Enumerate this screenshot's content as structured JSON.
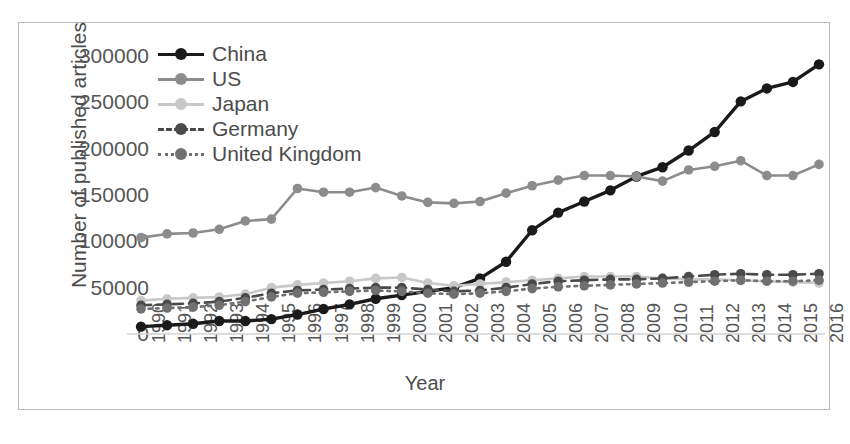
{
  "chart_data": {
    "type": "line",
    "title": "",
    "xlabel": "Year",
    "ylabel": "Number of published articles",
    "x": [
      1990,
      1991,
      1992,
      1993,
      1994,
      1995,
      1996,
      1997,
      1998,
      1999,
      2000,
      2001,
      2002,
      2003,
      2004,
      2005,
      2006,
      2007,
      2008,
      2009,
      2010,
      2011,
      2012,
      2013,
      2014,
      2015,
      2016
    ],
    "categories": [
      "1990",
      "1991",
      "1992",
      "1993",
      "1994",
      "1995",
      "1996",
      "1997",
      "1998",
      "1999",
      "2000",
      "2001",
      "2002",
      "2003",
      "2004",
      "2005",
      "2006",
      "2007",
      "2008",
      "2009",
      "2010",
      "2011",
      "2012",
      "2013",
      "2014",
      "2015",
      "2016"
    ],
    "xtick_labels": [
      "1990",
      "1991",
      "1992",
      "1993",
      "1994",
      "1995",
      "1996",
      "1997",
      "1998",
      "1999",
      "2000",
      "2001",
      "2002",
      "2003",
      "2004",
      "2005",
      "2006",
      "2007",
      "2008",
      "2009",
      "2010",
      "2011",
      "2012",
      "2013",
      "2014",
      "2015",
      "2016"
    ],
    "ytick_labels": [
      "0",
      "50000",
      "100000",
      "150000",
      "200000",
      "250000",
      "300000"
    ],
    "ytick_values": [
      0,
      50000,
      100000,
      150000,
      200000,
      250000,
      300000
    ],
    "ylim": [
      0,
      300000
    ],
    "grid": false,
    "legend_position": "top-left",
    "series": [
      {
        "name": "China",
        "color": "#1a1a1a",
        "style": "solid",
        "values": [
          8000,
          9500,
          11000,
          14000,
          14000,
          16000,
          21000,
          27000,
          32000,
          38000,
          42000,
          46000,
          50000,
          60000,
          78000,
          112000,
          131000,
          143000,
          155000,
          170000,
          180000,
          198000,
          218000,
          251000,
          265000,
          272000,
          291000
        ]
      },
      {
        "name": "US",
        "color": "#8c8c8c",
        "style": "solid",
        "values": [
          104000,
          108000,
          109000,
          113000,
          122000,
          124000,
          157000,
          153000,
          153000,
          158000,
          149000,
          142000,
          141000,
          143000,
          152000,
          160000,
          166000,
          171000,
          171000,
          170000,
          165000,
          177000,
          181000,
          187000,
          171000,
          171000,
          183000
        ]
      },
      {
        "name": "Japan",
        "color": "#c8c8c8",
        "style": "solid",
        "values": [
          36000,
          38000,
          39000,
          40000,
          43000,
          50000,
          53000,
          55000,
          57000,
          60000,
          61000,
          55000,
          52000,
          54000,
          56000,
          58000,
          60000,
          62000,
          62000,
          62000,
          60000,
          59000,
          59000,
          58000,
          57000,
          56000,
          55000
        ]
      },
      {
        "name": "Germany",
        "color": "#4a4a4a",
        "style": "dashed",
        "values": [
          31000,
          32000,
          33000,
          35000,
          39000,
          44000,
          47000,
          48000,
          49000,
          50000,
          50000,
          48000,
          46000,
          47000,
          50000,
          54000,
          57000,
          58000,
          59000,
          59000,
          60000,
          62000,
          64000,
          65000,
          64000,
          64000,
          65000
        ]
      },
      {
        "name": "United Kingdom",
        "color": "#707070",
        "style": "dotted",
        "values": [
          27000,
          28000,
          29000,
          31000,
          35000,
          40000,
          44000,
          45000,
          46000,
          47000,
          46000,
          44000,
          43000,
          44000,
          46000,
          49000,
          51000,
          52000,
          53000,
          54000,
          55000,
          56000,
          57000,
          58000,
          57000,
          57000,
          58000
        ]
      }
    ]
  },
  "legend": {
    "items": [
      {
        "label": "China"
      },
      {
        "label": "US"
      },
      {
        "label": "Japan"
      },
      {
        "label": "Germany"
      },
      {
        "label": "United Kingdom"
      }
    ]
  },
  "axes": {
    "y_title": "Number of published articles",
    "x_title": "Year"
  }
}
